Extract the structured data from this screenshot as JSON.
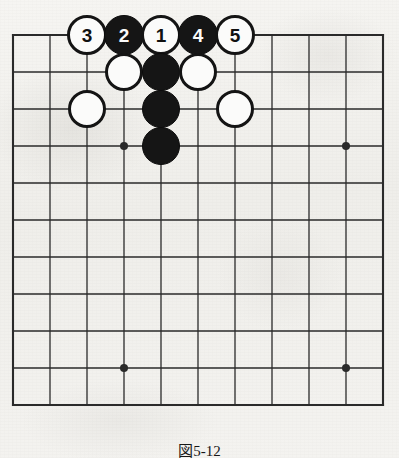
{
  "figure": {
    "kind": "go-board-diagram",
    "caption": "図5-12",
    "background_color": "#f2f1ee",
    "ink_color": "#1a1a1a"
  },
  "board": {
    "columns": 11,
    "rows": 11,
    "origin_x": 13,
    "origin_y": 35,
    "spacing": 37,
    "line_color": "#2a2a2a",
    "edge_line_width": 2.1,
    "inner_line_width": 1.3,
    "star_points": [
      {
        "col": 3,
        "row": 3
      },
      {
        "col": 9,
        "row": 3
      },
      {
        "col": 3,
        "row": 9
      },
      {
        "col": 9,
        "row": 9
      }
    ],
    "star_radius": 4
  },
  "stones": {
    "radius": 19,
    "numbered_radius": 20,
    "black_color": "#151515",
    "white_color": "#fbfbfa",
    "list": [
      {
        "id": "move-3",
        "col": 2,
        "row": 0,
        "color": "white",
        "label": "3"
      },
      {
        "id": "move-2",
        "col": 3,
        "row": 0,
        "color": "black",
        "label": "2"
      },
      {
        "id": "move-1",
        "col": 4,
        "row": 0,
        "color": "white",
        "label": "1"
      },
      {
        "id": "move-4",
        "col": 5,
        "row": 0,
        "color": "black",
        "label": "4"
      },
      {
        "id": "move-5",
        "col": 6,
        "row": 0,
        "color": "white",
        "label": "5"
      },
      {
        "id": "white-c3r1",
        "col": 3,
        "row": 1,
        "color": "white",
        "label": ""
      },
      {
        "id": "black-c4r1",
        "col": 4,
        "row": 1,
        "color": "black",
        "label": ""
      },
      {
        "id": "white-c5r1",
        "col": 5,
        "row": 1,
        "color": "white",
        "label": ""
      },
      {
        "id": "white-c2r2",
        "col": 2,
        "row": 2,
        "color": "white",
        "label": ""
      },
      {
        "id": "black-c4r2",
        "col": 4,
        "row": 2,
        "color": "black",
        "label": ""
      },
      {
        "id": "white-c6r2",
        "col": 6,
        "row": 2,
        "color": "white",
        "label": ""
      },
      {
        "id": "black-c4r3",
        "col": 4,
        "row": 3,
        "color": "black",
        "label": ""
      }
    ]
  }
}
